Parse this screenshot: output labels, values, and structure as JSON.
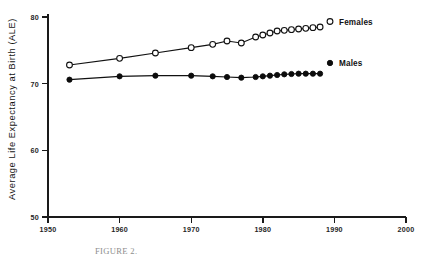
{
  "chart_data": {
    "type": "line",
    "title": "",
    "xlabel": "",
    "ylabel": "Average Life Expectancy at Birth (ALE)",
    "xlim": [
      1950,
      2000
    ],
    "ylim": [
      50,
      80
    ],
    "xticks": [
      1950,
      1960,
      1970,
      1980,
      1990,
      2000
    ],
    "yticks": [
      50,
      60,
      70,
      80
    ],
    "xtick_labels": [
      "1950",
      "1960",
      "1970",
      "1980",
      "1990",
      "1990_dummy"
    ],
    "grid": false,
    "legend_position": "right-inline",
    "series": [
      {
        "name": "Females",
        "marker": "open-circle",
        "x": [
          1953,
          1960,
          1965,
          1970,
          1973,
          1975,
          1977,
          1979,
          1980,
          1981,
          1982,
          1983,
          1984,
          1985,
          1986,
          1987,
          1988
        ],
        "values": [
          72.8,
          73.8,
          74.6,
          75.4,
          75.9,
          76.4,
          76.1,
          77.0,
          77.3,
          77.6,
          77.9,
          78.0,
          78.1,
          78.2,
          78.3,
          78.4,
          78.5
        ]
      },
      {
        "name": "Males",
        "marker": "filled-circle",
        "x": [
          1953,
          1960,
          1965,
          1970,
          1973,
          1975,
          1977,
          1979,
          1980,
          1981,
          1982,
          1983,
          1984,
          1985,
          1986,
          1987,
          1988
        ],
        "values": [
          70.6,
          71.1,
          71.2,
          71.2,
          71.1,
          71.0,
          70.9,
          71.0,
          71.1,
          71.2,
          71.3,
          71.4,
          71.45,
          71.5,
          71.5,
          71.5,
          71.5
        ]
      }
    ]
  },
  "yaxis": {
    "label": "Average Life Expectancy at Birth (ALE)",
    "ticks": [
      {
        "value": "80"
      },
      {
        "value": "70"
      },
      {
        "value": "60"
      },
      {
        "value": "50"
      }
    ]
  },
  "xaxis": {
    "ticks": [
      {
        "value": "1950"
      },
      {
        "value": "1960"
      },
      {
        "value": "1970"
      },
      {
        "value": "1980"
      },
      {
        "value": "1990"
      },
      {
        "value": "2000"
      }
    ]
  },
  "legend": {
    "females": "Females",
    "males": "Males"
  },
  "caption": {
    "text": "FIGURE 2."
  },
  "colors": {
    "ink": "#111111",
    "marker_fill_open": "#ffffff",
    "marker_fill_closed": "#0c0c0c",
    "background": "#ffffff"
  }
}
